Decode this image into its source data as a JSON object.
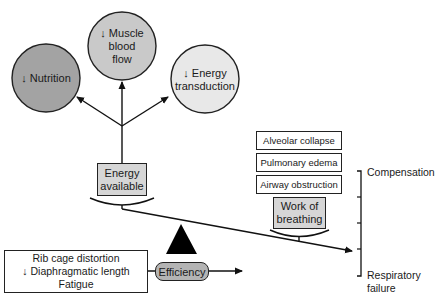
{
  "diagram": {
    "type": "balance-scale concept diagram",
    "circles": [
      {
        "id": "nutrition",
        "label": "↓ Nutrition",
        "fill": "#a3a3a3"
      },
      {
        "id": "muscle_blood_flow",
        "label_lines": [
          "↓ Muscle",
          "blood",
          "flow"
        ],
        "fill": "#c9c9c9"
      },
      {
        "id": "energy_transduction",
        "label_lines": [
          "↓ Energy",
          "transduction"
        ],
        "fill": "#e8e8e8"
      }
    ],
    "energy_available": {
      "label_lines": [
        "Energy",
        "available"
      ],
      "fill": "#d6d6d6"
    },
    "load_factors": [
      {
        "label": "Alveolar collapse"
      },
      {
        "label": "Pulmonary edema"
      },
      {
        "label": "Airway obstruction"
      }
    ],
    "work_of_breathing": {
      "label_lines": [
        "Work of",
        "breathing"
      ],
      "fill": "#d6d6d6"
    },
    "scale_labels": {
      "top": "Compensation",
      "bottom_lines": [
        "Respiratory",
        "failure"
      ]
    },
    "efficiency": {
      "label": "Efficiency",
      "fill": "#b4b4b4"
    },
    "efficiency_factors": {
      "lines": [
        "Rib cage distortion",
        "↓ Diaphragmatic length",
        "Fatigue"
      ]
    }
  }
}
